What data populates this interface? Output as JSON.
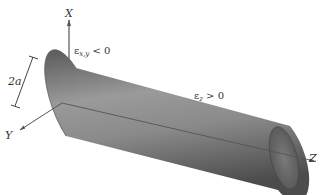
{
  "figure": {
    "type": "cylinder-strain-diagram",
    "axes": {
      "x_label": "X",
      "y_label": "Y",
      "z_label": "Z"
    },
    "dimension": {
      "label": "2a"
    },
    "annotations": {
      "transverse_strain": {
        "symbol": "ε",
        "subscript": "x,y",
        "relation": "< 0"
      },
      "axial_strain": {
        "symbol": "ε",
        "subscript": "z",
        "relation": "> 0"
      }
    },
    "colors": {
      "cylinder_light": "#a8a8a8",
      "cylinder_dark": "#4a4a4a",
      "axis_line": "#555555",
      "text": "#333333"
    }
  }
}
